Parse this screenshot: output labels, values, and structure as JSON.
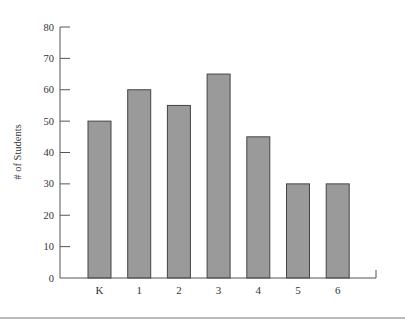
{
  "chart_data": {
    "type": "bar",
    "title": "",
    "xlabel": "",
    "ylabel": "# of Students",
    "categories": [
      "K",
      "1",
      "2",
      "3",
      "4",
      "5",
      "6"
    ],
    "values": [
      50,
      60,
      55,
      65,
      45,
      30,
      30
    ],
    "ylim": [
      0,
      80
    ],
    "yticks": [
      0,
      10,
      20,
      30,
      40,
      50,
      60,
      70,
      80
    ],
    "grid": false,
    "legend": null,
    "colors": {
      "bar_fill": "#9a9a9a",
      "bar_stroke": "#444444",
      "axis": "#555555"
    }
  }
}
